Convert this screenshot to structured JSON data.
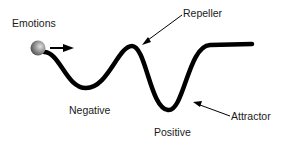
{
  "diagram": {
    "labels": {
      "emotions": "Emotions",
      "repeller": "Repeller",
      "negative": "Negative",
      "attractor": "Attractor",
      "positive": "Positive"
    },
    "colors": {
      "curve": "#000000",
      "ball_light": "#d8d8d8",
      "ball_dark": "#555555",
      "text": "#1a1a1a"
    }
  }
}
